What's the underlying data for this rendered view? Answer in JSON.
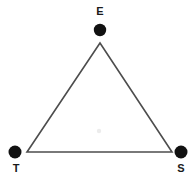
{
  "diagram": {
    "type": "triangle-with-labeled-vertices",
    "background_color": "#ffffff",
    "stroke_color": "#4d4d4d",
    "stroke_width": 1.6,
    "marker_color": "#111111",
    "label_color": "#1a1a1a",
    "faint_center_mark_color": "#e8e8e8",
    "canvas": {
      "width": 196,
      "height": 185
    },
    "triangle": {
      "apex": {
        "x": 100,
        "y": 43
      },
      "bottom_left": {
        "x": 27,
        "y": 152
      },
      "bottom_right": {
        "x": 172,
        "y": 152
      }
    },
    "vertices": [
      {
        "label": "E",
        "marker_cx": 100,
        "marker_cy": 30,
        "marker_r": 6.2,
        "label_x": 93,
        "label_y": 6
      },
      {
        "label": "T",
        "marker_cx": 15,
        "marker_cy": 152,
        "marker_r": 6.5,
        "label_x": 9,
        "label_y": 163
      },
      {
        "label": "S",
        "marker_cx": 181,
        "marker_cy": 152,
        "marker_r": 6.5,
        "label_x": 174,
        "label_y": 163
      }
    ],
    "center_mark": {
      "cx": 99,
      "cy": 131,
      "r": 2.2
    }
  }
}
